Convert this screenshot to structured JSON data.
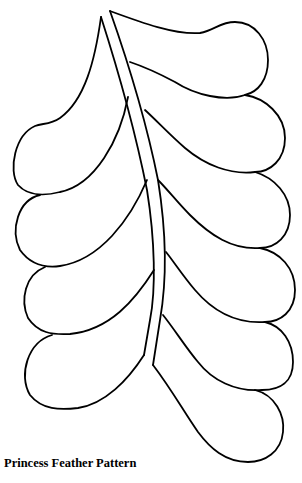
{
  "page": {
    "caption": "Princess Feather Pattern"
  },
  "figure": {
    "stroke_color": "#000000",
    "background_color": "#ffffff",
    "left_plumes": 4,
    "right_plumes": 6
  }
}
